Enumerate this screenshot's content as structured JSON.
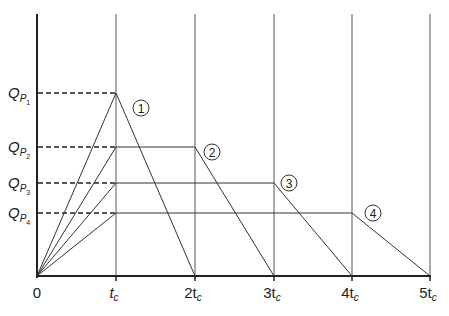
{
  "diagram": {
    "title": "",
    "x_axis": {
      "ticks": [
        {
          "label": "0",
          "base": "0",
          "sub": ""
        },
        {
          "label": "t_c",
          "base": "t",
          "sub": "c"
        },
        {
          "label": "2t_c",
          "base": "2t",
          "sub": "c"
        },
        {
          "label": "3t_c",
          "base": "3t",
          "sub": "c"
        },
        {
          "label": "4t_c",
          "base": "4t",
          "sub": "c"
        },
        {
          "label": "5t_c",
          "base": "5t",
          "sub": "c"
        }
      ]
    },
    "y_axis": {
      "ticks": [
        {
          "label": "Q_P1",
          "base": "Q",
          "sub": "P",
          "subsub": "1"
        },
        {
          "label": "Q_P2",
          "base": "Q",
          "sub": "P",
          "subsub": "2"
        },
        {
          "label": "Q_P3",
          "base": "Q",
          "sub": "P",
          "subsub": "3"
        },
        {
          "label": "Q_P4",
          "base": "Q",
          "sub": "P",
          "subsub": "4"
        }
      ]
    },
    "hydrographs": [
      {
        "id": "1",
        "label": "1",
        "peak": "Q_P1",
        "rise_end": "t_c",
        "recession_start": "t_c",
        "end": "2t_c"
      },
      {
        "id": "2",
        "label": "2",
        "peak": "Q_P2",
        "rise_end": "t_c",
        "recession_start": "2t_c",
        "end": "3t_c"
      },
      {
        "id": "3",
        "label": "3",
        "peak": "Q_P3",
        "rise_end": "t_c",
        "recession_start": "3t_c",
        "end": "4t_c"
      },
      {
        "id": "4",
        "label": "4",
        "peak": "Q_P4",
        "rise_end": "t_c",
        "recession_start": "4t_c",
        "end": "5t_c"
      }
    ],
    "caption": ""
  }
}
